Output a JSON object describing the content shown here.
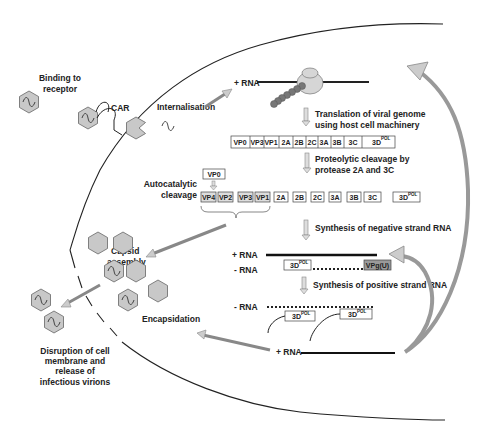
{
  "diagram": {
    "labels": {
      "binding": [
        "Binding to",
        "receptor"
      ],
      "car": "CAR",
      "internalisation": "Internalisation",
      "plus_rna_top": "+ RNA",
      "translation": [
        "Translation of viral genome",
        "using host cell machinery"
      ],
      "proteolytic": [
        "Proteolytic cleavage by",
        "protease 2A and 3C"
      ],
      "autocatalytic": [
        "Autocatalytic",
        "cleavage"
      ],
      "neg_synthesis": "Synthesis of negative strand RNA",
      "capsid_assembly": [
        "Capsid",
        "assembly"
      ],
      "plus_rna_mid": "+ RNA",
      "minus_rna_mid": "- RNA",
      "pos_synthesis": "Synthesis of positive strand RNA",
      "minus_rna_low": "- RNA",
      "encapsidation": "Encapsidation",
      "plus_rna_bottom": "+ RNA",
      "disruption": [
        "Disruption of cell",
        "membrane and",
        "release of",
        "infectious virions"
      ]
    },
    "polyprotein": [
      "VP0",
      "VP3",
      "VP1",
      "2A",
      "2B",
      "2C",
      "3A",
      "3B",
      "3C",
      "3D"
    ],
    "cleaved_proteins": [
      "VP4",
      "VP2",
      "VP3",
      "VP1",
      "2A",
      "2B",
      "2C",
      "3A",
      "3B",
      "3C",
      "3D"
    ],
    "vp0_box": "VP0",
    "pol_superscript": "POL",
    "vpg_label": "VPg(U)",
    "polymerase_label": "3D",
    "colors": {
      "hexagon_fill": "#c8c8c8",
      "hexagon_stroke": "#666666",
      "arrow_fill": "#b0b0b0",
      "line": "#222222",
      "vpg_fill": "#9a9a9a"
    }
  }
}
